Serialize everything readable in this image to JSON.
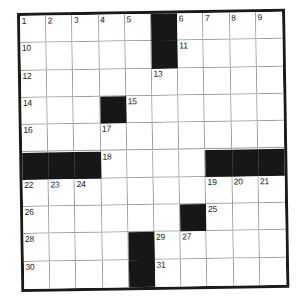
{
  "puzzle": {
    "type": "crossword-grid",
    "rows": 10,
    "columns": 10,
    "grid_colors": {
      "background": "#ffffff",
      "block": "#171717",
      "border": "#1a1a1a",
      "cell_line": "#9a9a9a",
      "number_text": "#1c1c1c"
    },
    "black_cells": [
      {
        "row": 1,
        "col": 6
      },
      {
        "row": 2,
        "col": 6
      },
      {
        "row": 4,
        "col": 4
      },
      {
        "row": 6,
        "col": 1
      },
      {
        "row": 6,
        "col": 2
      },
      {
        "row": 6,
        "col": 3
      },
      {
        "row": 6,
        "col": 8
      },
      {
        "row": 6,
        "col": 9
      },
      {
        "row": 6,
        "col": 10
      },
      {
        "row": 8,
        "col": 7
      },
      {
        "row": 9,
        "col": 5
      },
      {
        "row": 10,
        "col": 5
      }
    ],
    "numbered_cells": [
      {
        "row": 1,
        "col": 1,
        "number": "1"
      },
      {
        "row": 1,
        "col": 2,
        "number": "2"
      },
      {
        "row": 1,
        "col": 3,
        "number": "3"
      },
      {
        "row": 1,
        "col": 4,
        "number": "4"
      },
      {
        "row": 1,
        "col": 5,
        "number": "5"
      },
      {
        "row": 1,
        "col": 7,
        "number": "6"
      },
      {
        "row": 1,
        "col": 8,
        "number": "7"
      },
      {
        "row": 1,
        "col": 9,
        "number": "8"
      },
      {
        "row": 1,
        "col": 10,
        "number": "9"
      },
      {
        "row": 2,
        "col": 1,
        "number": "10"
      },
      {
        "row": 2,
        "col": 7,
        "number": "11"
      },
      {
        "row": 3,
        "col": 1,
        "number": "12"
      },
      {
        "row": 3,
        "col": 6,
        "number": "13"
      },
      {
        "row": 4,
        "col": 1,
        "number": "14"
      },
      {
        "row": 4,
        "col": 5,
        "number": "15"
      },
      {
        "row": 5,
        "col": 1,
        "number": "16"
      },
      {
        "row": 5,
        "col": 4,
        "number": "17"
      },
      {
        "row": 6,
        "col": 4,
        "number": "18"
      },
      {
        "row": 7,
        "col": 1,
        "number": "22"
      },
      {
        "row": 7,
        "col": 2,
        "number": "23"
      },
      {
        "row": 7,
        "col": 3,
        "number": "24"
      },
      {
        "row": 7,
        "col": 8,
        "number": "19"
      },
      {
        "row": 7,
        "col": 9,
        "number": "20"
      },
      {
        "row": 7,
        "col": 10,
        "number": "21"
      },
      {
        "row": 8,
        "col": 1,
        "number": "26"
      },
      {
        "row": 8,
        "col": 8,
        "number": "25"
      },
      {
        "row": 9,
        "col": 1,
        "number": "28"
      },
      {
        "row": 9,
        "col": 6,
        "number": "29"
      },
      {
        "row": 9,
        "col": 7,
        "number": "27"
      },
      {
        "row": 10,
        "col": 1,
        "number": "30"
      },
      {
        "row": 10,
        "col": 6,
        "number": "31"
      }
    ]
  }
}
